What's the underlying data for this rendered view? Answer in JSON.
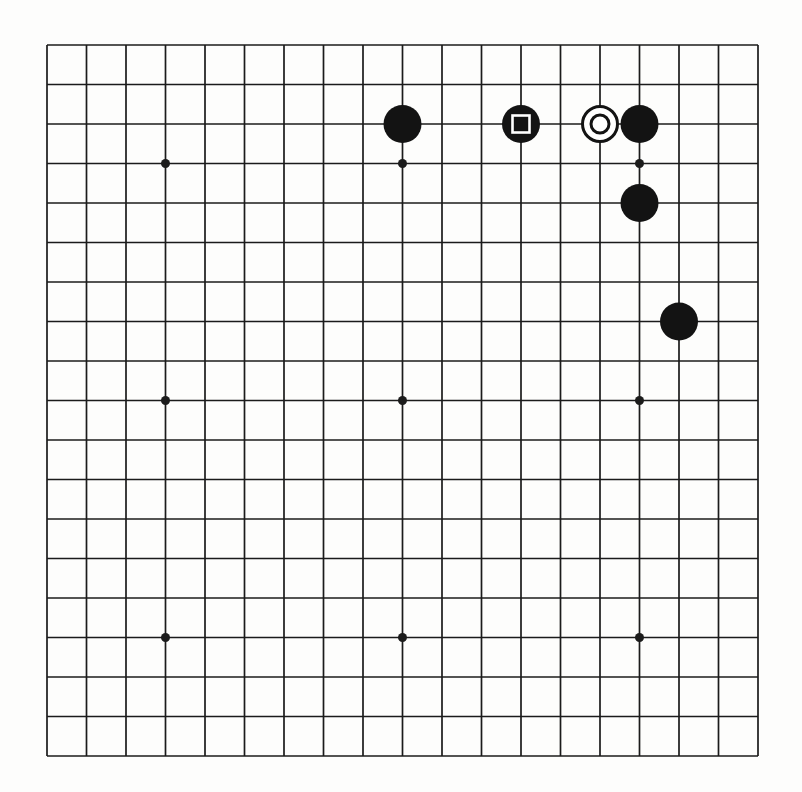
{
  "board": {
    "grid_size": 19,
    "paper_color": "#fdfdfc",
    "line_color": "#1b1b1b",
    "stone_black_color": "#131313",
    "stone_white_color": "#ffffff",
    "marker_on_black_color": "#ffffff",
    "marker_on_white_color": "#131313",
    "layout": {
      "origin_x": 47,
      "origin_y": 45,
      "cell": 39.5,
      "line_width": 1.7,
      "stone_radius": 19,
      "star_radius": 4.5,
      "square_marker_side": 17,
      "square_marker_stroke": 2.6,
      "circle_marker_radius": 9,
      "circle_marker_stroke": 3,
      "white_stone_stroke": 3
    },
    "star_points": [
      [
        3,
        3
      ],
      [
        9,
        3
      ],
      [
        15,
        3
      ],
      [
        3,
        9
      ],
      [
        9,
        9
      ],
      [
        15,
        9
      ],
      [
        3,
        15
      ],
      [
        9,
        15
      ],
      [
        15,
        15
      ]
    ],
    "stones": [
      {
        "col": 9,
        "row": 2,
        "color": "black",
        "marker": "none"
      },
      {
        "col": 12,
        "row": 2,
        "color": "black",
        "marker": "square"
      },
      {
        "col": 14,
        "row": 2,
        "color": "white",
        "marker": "circle"
      },
      {
        "col": 15,
        "row": 2,
        "color": "black",
        "marker": "none"
      },
      {
        "col": 15,
        "row": 4,
        "color": "black",
        "marker": "none"
      },
      {
        "col": 16,
        "row": 7,
        "color": "black",
        "marker": "none"
      }
    ]
  }
}
